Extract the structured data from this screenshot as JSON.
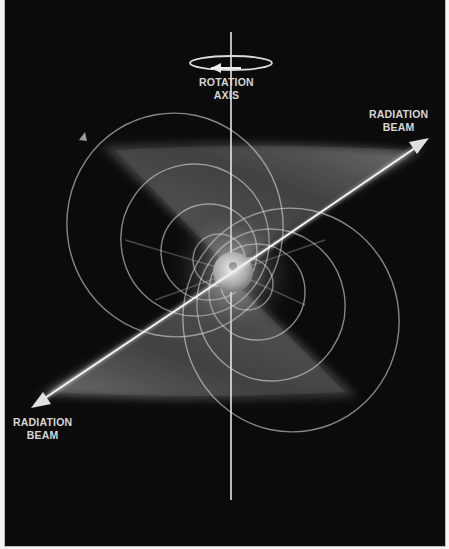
{
  "figure": {
    "colors": {
      "background": "#0b0b0b",
      "page": "#f4f4f4",
      "border": "#bdbdbd",
      "lines": "#e8e8e8",
      "labels": "#d6d6d6"
    },
    "labels": {
      "rotation_axis": {
        "line1": "ROTATION",
        "line2": "AXIS"
      },
      "beam_top_right": {
        "line1": "RADIATION",
        "line2": "BEAM"
      },
      "beam_bottom_left": {
        "line1": "RADIATION",
        "line2": "BEAM"
      }
    },
    "icons": {
      "rotation_arrow": "rotation-direction-ellipse-arrow",
      "beam_arrow_ne": "arrow-up-right",
      "beam_arrow_sw": "arrow-down-left"
    }
  }
}
